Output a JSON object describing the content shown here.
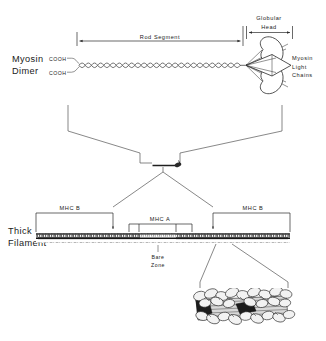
{
  "figure": {
    "background_color": "#ffffff",
    "ink_color": "#1a1a1a"
  },
  "panel_top": {
    "name": "myosin-dimer-panel",
    "left_label_line1": "Myosin",
    "left_label_line2": "Dimer",
    "cooh_upper": "COOH",
    "cooh_lower": "COOH",
    "rod_segment_label": "Rod  Segment",
    "globular_head_line1": "Globular",
    "globular_head_line2": "Head",
    "light_chains_line1": "Myosin",
    "light_chains_line2": "Light",
    "light_chains_line3": "Chains"
  },
  "panel_middle": {
    "name": "funnel-to-single-molecule",
    "icon": "single-myosin-molecule"
  },
  "panel_filament": {
    "name": "thick-filament-panel",
    "left_label_line1": "Thick",
    "left_label_line2": "Filament",
    "mhc_b_left": "MHC B",
    "mhc_b_right": "MHC B",
    "mhc_a": "MHC A",
    "bare_zone_line1": "Bare",
    "bare_zone_line2": "Zone"
  },
  "panel_inset": {
    "name": "filament-detail-inset",
    "description": "packed-myosin-heads-on-filament-core"
  },
  "colors": {
    "ink": "#1a1a1a",
    "line": "#2a2a2a",
    "leader": "#555555",
    "filament_core": "#3a3a3a",
    "blob_fill": "#f2f2f2",
    "blob_dark": "#1c1c1c",
    "rod_band": "#d8d8d8",
    "page": "#ffffff"
  }
}
